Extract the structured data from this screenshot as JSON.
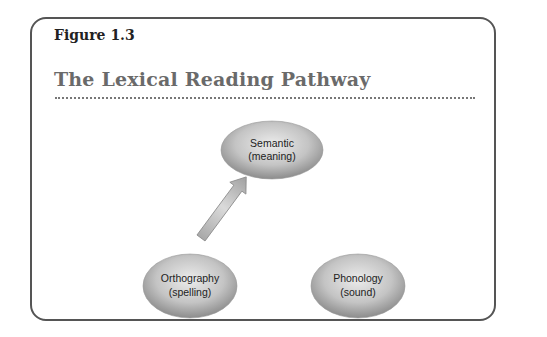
{
  "figure": {
    "label": "Figure 1.3",
    "title": "The Lexical Reading Pathway"
  },
  "nodes": [
    {
      "id": "semantic",
      "line1": "Semantic",
      "line2": "(meaning)"
    },
    {
      "id": "orthography",
      "line1": "Orthography",
      "line2": "(spelling)"
    },
    {
      "id": "phonology",
      "line1": "Phonology",
      "line2": "(sound)"
    }
  ],
  "edges": [
    {
      "from": "orthography",
      "to": "semantic"
    }
  ],
  "colors": {
    "frame": "#555555",
    "title": "#6a6a6a",
    "node_fill_light": "#e6e6e6",
    "node_fill_dark": "#8f8f8f",
    "arrow_fill": "#c8c8c8"
  }
}
